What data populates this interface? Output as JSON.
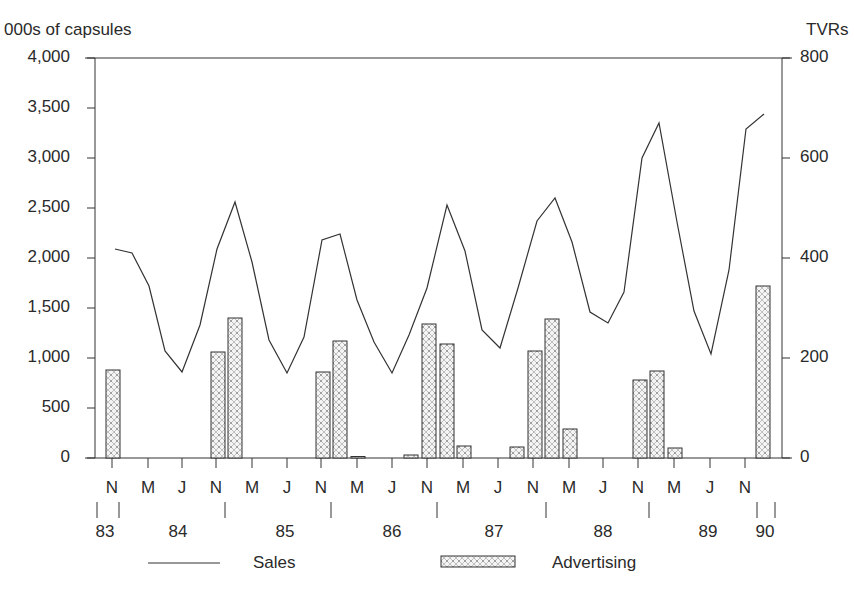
{
  "chart_data": {
    "type": "bar+line",
    "title": "",
    "ylabel_left": "000s of capsules",
    "ylabel_right": "TVRs",
    "ylim_left": [
      0,
      4000
    ],
    "ylim_right": [
      0,
      800
    ],
    "yticks_left": [
      "4,000",
      "3,500",
      "3,000",
      "2,500",
      "2,000",
      "1,500",
      "1,000",
      "500",
      "0"
    ],
    "yticks_right": [
      "800",
      "600",
      "400",
      "200",
      "0"
    ],
    "month_ticks": [
      "N",
      "M",
      "J",
      "N",
      "M",
      "J",
      "N",
      "M",
      "J",
      "N",
      "M",
      "J",
      "N",
      "M",
      "J",
      "N",
      "M",
      "J",
      "N"
    ],
    "year_labels": [
      "83",
      "84",
      "85",
      "86",
      "87",
      "88",
      "89",
      "90"
    ],
    "grid": false,
    "legend": [
      {
        "name": "Sales",
        "style": "line"
      },
      {
        "name": "Advertising",
        "style": "hatched-bar"
      }
    ],
    "series": [
      {
        "name": "Sales",
        "axis": "left",
        "unit": "000s of capsules",
        "interval": "bimonthly, Nov 1983 - Jan 1990",
        "values": [
          2090,
          2050,
          1720,
          1070,
          860,
          1330,
          2090,
          2560,
          1960,
          1180,
          850,
          1210,
          2180,
          2240,
          1580,
          1160,
          850,
          1230,
          1700,
          2530,
          2070,
          1280,
          1100,
          1700,
          2370,
          2600,
          2160,
          1460,
          1350,
          1660,
          3000,
          3350,
          2360,
          1470,
          1040,
          1880,
          3290,
          3440
        ]
      },
      {
        "name": "Advertising",
        "axis": "right",
        "unit": "TVRs",
        "bars": [
          {
            "period": "Nov 83",
            "value": 176
          },
          {
            "period": "Nov 84",
            "value": 212
          },
          {
            "period": "Jan 85",
            "value": 280
          },
          {
            "period": "Nov 85",
            "value": 172
          },
          {
            "period": "Jan 86",
            "value": 234
          },
          {
            "period": "Mar 86",
            "value": 3
          },
          {
            "period": "Sep 86",
            "value": 6
          },
          {
            "period": "Nov 86",
            "value": 268
          },
          {
            "period": "Jan 87",
            "value": 228
          },
          {
            "period": "Mar 87",
            "value": 24
          },
          {
            "period": "Sep 87",
            "value": 22
          },
          {
            "period": "Nov 87",
            "value": 214
          },
          {
            "period": "Jan 88",
            "value": 278
          },
          {
            "period": "Mar 88",
            "value": 58
          },
          {
            "period": "Nov 88",
            "value": 156
          },
          {
            "period": "Jan 89",
            "value": 174
          },
          {
            "period": "Mar 89",
            "value": 20
          },
          {
            "period": "Jan 90",
            "value": 344
          }
        ]
      }
    ]
  },
  "layout": {
    "line_x": [
      115,
      132,
      149,
      165,
      182,
      200,
      217,
      235,
      252,
      269,
      287,
      304,
      322,
      340,
      357,
      374,
      392,
      409,
      427,
      447,
      465,
      482,
      500,
      518,
      537,
      555,
      572,
      590,
      608,
      624,
      642,
      659,
      677,
      694,
      711,
      729,
      746,
      764
    ],
    "bar_x": [
      106,
      211,
      228,
      316,
      333,
      351,
      404,
      422,
      440,
      457,
      510,
      528,
      545,
      563,
      633,
      650,
      668,
      756
    ],
    "month_tick_x": [
      112,
      148,
      182,
      216,
      252,
      287,
      321,
      357,
      392,
      427,
      463,
      498,
      533,
      569,
      603,
      638,
      674,
      710,
      745
    ],
    "year_sep_x": [
      97,
      119,
      225,
      331,
      437,
      546,
      649,
      757,
      775
    ],
    "year_label_x": [
      105,
      178,
      285,
      392,
      494,
      603,
      708,
      765
    ]
  }
}
